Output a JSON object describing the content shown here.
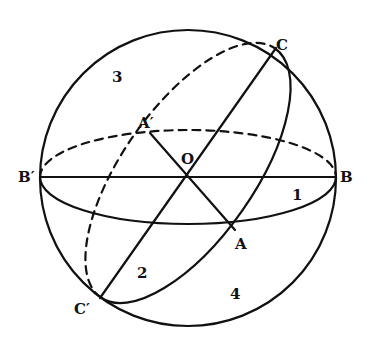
{
  "diagram": {
    "type": "sphere-great-circles",
    "points": {
      "O": "O",
      "A": "A",
      "A_prime": "A′",
      "B": "B",
      "B_prime": "B′",
      "C": "C",
      "C_prime": "C′"
    },
    "regions": {
      "r1": "1",
      "r2": "2",
      "r3": "3",
      "r4": "4"
    },
    "stroke_color": "#111111"
  }
}
